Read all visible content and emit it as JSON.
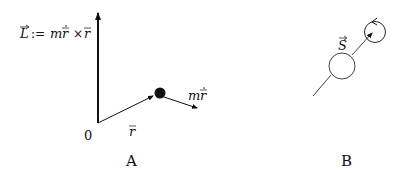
{
  "panels": [
    {
      "id": "A",
      "caption": "A",
      "angular_momentum_label": {
        "lhs": "L",
        "def": ":=",
        "m": "m",
        "r_dot": "r",
        "cross": "×",
        "r": "r"
      },
      "origin_label": "0",
      "position_vector_label": "r",
      "momentum_label": {
        "m": "m",
        "r_dot": "r"
      }
    },
    {
      "id": "B",
      "caption": "B",
      "spin_label": "S"
    }
  ],
  "colors": {
    "ink": "#111111",
    "background": "#ffffff"
  }
}
